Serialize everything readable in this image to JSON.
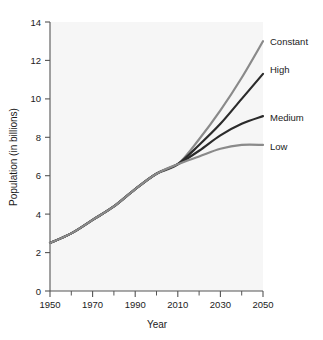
{
  "chart_data": {
    "type": "line",
    "title": "",
    "xlabel": "Year",
    "ylabel": "Population (in billions)",
    "xlim": [
      1950,
      2050
    ],
    "ylim": [
      0,
      14
    ],
    "grid": false,
    "legend_position": "right-inline-labels",
    "x_major_ticks": [
      1950,
      1970,
      1990,
      2010,
      2030,
      2050
    ],
    "x_minor_ticks": [
      1960,
      1980,
      2000,
      2020,
      2040
    ],
    "x_tick_labels": [
      "1950",
      "1970",
      "1990",
      "2010",
      "2030",
      "2050"
    ],
    "y_major_ticks": [
      0,
      2,
      4,
      6,
      8,
      10,
      12,
      14
    ],
    "y_tick_labels": [
      "0",
      "2",
      "4",
      "6",
      "8",
      "10",
      "12",
      "14"
    ],
    "x": [
      1950,
      1960,
      1970,
      1980,
      1990,
      2000,
      2010,
      2020,
      2030,
      2040,
      2050
    ],
    "series": [
      {
        "name": "Constant",
        "color": "#8a8a8a",
        "label_value": "Constant",
        "values": [
          2.5,
          3.0,
          3.7,
          4.4,
          5.3,
          6.1,
          6.6,
          7.9,
          9.4,
          11.1,
          13.0
        ]
      },
      {
        "name": "High",
        "color": "#2b2b2b",
        "label_value": "High",
        "values": [
          2.5,
          3.0,
          3.7,
          4.4,
          5.3,
          6.1,
          6.6,
          7.6,
          8.7,
          10.0,
          11.3
        ]
      },
      {
        "name": "Medium",
        "color": "#2b2b2b",
        "label_value": "Medium",
        "values": [
          2.5,
          3.0,
          3.7,
          4.4,
          5.3,
          6.1,
          6.6,
          7.3,
          8.1,
          8.7,
          9.1
        ]
      },
      {
        "name": "Low",
        "color": "#8a8a8a",
        "label_value": "Low",
        "values": [
          2.5,
          3.0,
          3.7,
          4.4,
          5.3,
          6.1,
          6.6,
          7.0,
          7.4,
          7.6,
          7.6
        ]
      }
    ]
  },
  "axes": {
    "y_title": "Population (in billions)",
    "x_title": "Year",
    "y_ticks": [
      "14",
      "12",
      "10",
      "8",
      "6",
      "4",
      "2",
      "0"
    ],
    "x_ticks": [
      "1950",
      "1970",
      "1990",
      "2010",
      "2030",
      "2050"
    ]
  },
  "series_labels": {
    "constant": "Constant",
    "high": "High",
    "medium": "Medium",
    "low": "Low"
  },
  "colors": {
    "plot_background": "#f6f6f6",
    "axis": "#555555",
    "text": "#1b1b1b",
    "gray_series": "#8a8a8a",
    "dark_series": "#2b2b2b"
  }
}
